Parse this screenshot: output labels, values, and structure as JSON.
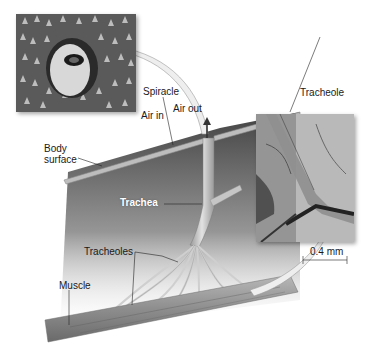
{
  "diagram": {
    "labels": {
      "spiracle": "Spiracle",
      "air_in": "Air in",
      "air_out": "Air out",
      "body_surface_line1": "Body",
      "body_surface_line2": "surface",
      "trachea": "Trachea",
      "tracheoles": "Tracheoles",
      "muscle": "Muscle",
      "tracheole": "Tracheole",
      "scale_bar": "0.4 mm"
    },
    "insets": [
      {
        "name": "spiracle-micrograph",
        "description": "SEM of spiracle on body surface"
      },
      {
        "name": "tracheole-micrograph",
        "description": "Light micrograph of tracheole"
      }
    ],
    "colors": {
      "body_wall_dark": "#3a3a3a",
      "body_wall_light": "#d9d9d9",
      "tube": "#c8c8c8",
      "muscle": "#8a8a8a",
      "arrow": "#e8e8e8"
    }
  }
}
